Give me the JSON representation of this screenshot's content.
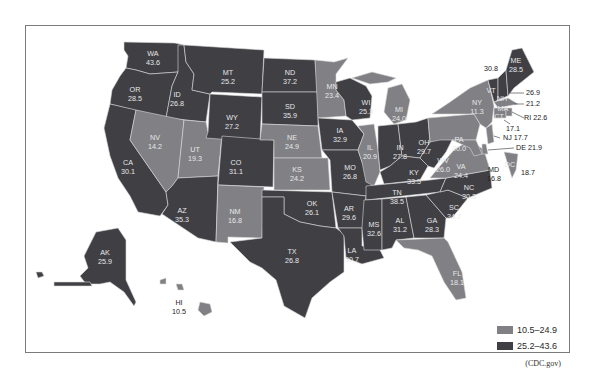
{
  "legend": {
    "items": [
      {
        "label": "10.5–24.9",
        "color": "#808085"
      },
      {
        "label": "25.2–43.6",
        "color": "#3f3f44"
      }
    ]
  },
  "source": "(CDC.gov)",
  "colors": {
    "dark": "#3f3f44",
    "light": "#808085",
    "border": "#d9d9d9"
  },
  "states": [
    {
      "abbr": "WA",
      "value": "43.6",
      "class": "dark"
    },
    {
      "abbr": "OR",
      "value": "28.5",
      "class": "dark"
    },
    {
      "abbr": "CA",
      "value": "30.1",
      "class": "dark"
    },
    {
      "abbr": "ID",
      "value": "26.8",
      "class": "dark"
    },
    {
      "abbr": "NV",
      "value": "14.2",
      "class": "light"
    },
    {
      "abbr": "UT",
      "value": "19.3",
      "class": "light"
    },
    {
      "abbr": "AZ",
      "value": "35.3",
      "class": "dark"
    },
    {
      "abbr": "MT",
      "value": "25.2",
      "class": "dark"
    },
    {
      "abbr": "WY",
      "value": "27.2",
      "class": "dark"
    },
    {
      "abbr": "CO",
      "value": "31.1",
      "class": "dark"
    },
    {
      "abbr": "NM",
      "value": "16.8",
      "class": "light"
    },
    {
      "abbr": "ND",
      "value": "37.2",
      "class": "dark"
    },
    {
      "abbr": "SD",
      "value": "35.9",
      "class": "dark"
    },
    {
      "abbr": "NE",
      "value": "24.9",
      "class": "light"
    },
    {
      "abbr": "KS",
      "value": "24.2",
      "class": "light"
    },
    {
      "abbr": "OK",
      "value": "26.1",
      "class": "dark"
    },
    {
      "abbr": "TX",
      "value": "26.8",
      "class": "dark"
    },
    {
      "abbr": "MN",
      "value": "23.4",
      "class": "light"
    },
    {
      "abbr": "IA",
      "value": "32.9",
      "class": "dark"
    },
    {
      "abbr": "MO",
      "value": "26.8",
      "class": "dark"
    },
    {
      "abbr": "AR",
      "value": "29.6",
      "class": "dark"
    },
    {
      "abbr": "LA",
      "value": "30.7",
      "class": "dark"
    },
    {
      "abbr": "WI",
      "value": "25.3",
      "class": "dark"
    },
    {
      "abbr": "IL",
      "value": "20.9",
      "class": "light"
    },
    {
      "abbr": "MI",
      "value": "24.0",
      "class": "light"
    },
    {
      "abbr": "IN",
      "value": "27.8",
      "class": "dark"
    },
    {
      "abbr": "OH",
      "value": "29.7",
      "class": "dark"
    },
    {
      "abbr": "KY",
      "value": "33.5",
      "class": "dark"
    },
    {
      "abbr": "TN",
      "value": "38.5",
      "class": "dark"
    },
    {
      "abbr": "MS",
      "value": "32.6",
      "class": "dark"
    },
    {
      "abbr": "AL",
      "value": "31.2",
      "class": "dark"
    },
    {
      "abbr": "GA",
      "value": "28.3",
      "class": "dark"
    },
    {
      "abbr": "FL",
      "value": "18.1",
      "class": "light"
    },
    {
      "abbr": "SC",
      "value": "34.7",
      "class": "dark"
    },
    {
      "abbr": "NC",
      "value": "30.3",
      "class": "dark"
    },
    {
      "abbr": "VA",
      "value": "24.4",
      "class": "light"
    },
    {
      "abbr": "WV",
      "value": "26.0",
      "class": "dark"
    },
    {
      "abbr": "PA",
      "value": "20.0",
      "class": "light"
    },
    {
      "abbr": "NY",
      "value": "11.3",
      "class": "light"
    },
    {
      "abbr": "VT",
      "value": "30.8",
      "class": "dark"
    },
    {
      "abbr": "NH",
      "value": "26.9",
      "class": "dark"
    },
    {
      "abbr": "ME",
      "value": "28.5",
      "class": "dark"
    },
    {
      "abbr": "MA",
      "value": "21.2",
      "class": "light"
    },
    {
      "abbr": "RI",
      "value": "22.6",
      "class": "light"
    },
    {
      "abbr": "CT",
      "value": "17.1",
      "class": "light"
    },
    {
      "abbr": "NJ",
      "value": "17.7",
      "class": "light"
    },
    {
      "abbr": "DE",
      "value": "21.9",
      "class": "light"
    },
    {
      "abbr": "MD",
      "value": "16.8",
      "class": "light"
    },
    {
      "abbr": "DC",
      "value": "18.7",
      "class": "light"
    },
    {
      "abbr": "AK",
      "value": "25.9",
      "class": "dark"
    },
    {
      "abbr": "HI",
      "value": "10.5",
      "class": "light"
    }
  ],
  "labels": {
    "WA": "WA",
    "OR": "OR",
    "CA": "CA",
    "ID": "ID",
    "NV": "NV",
    "UT": "UT",
    "AZ": "AZ",
    "MT": "MT",
    "WY": "WY",
    "CO": "CO",
    "NM": "NM",
    "ND": "ND",
    "SD": "SD",
    "NE": "NE",
    "KS": "KS",
    "OK": "OK",
    "TX": "TX",
    "MN": "MN",
    "IA": "IA",
    "MO": "MO",
    "AR": "AR",
    "LA": "LA",
    "WI": "WI",
    "IL": "IL",
    "MI": "MI",
    "IN": "IN",
    "OH": "OH",
    "KY": "KY",
    "TN": "TN",
    "MS": "MS",
    "AL": "AL",
    "GA": "GA",
    "FL": "FL",
    "SC": "SC",
    "NC": "NC",
    "VA": "VA",
    "WV": "WV",
    "PA": "PA",
    "NY": "NY",
    "VT": "VT",
    "NH": "NH",
    "ME": "ME",
    "MA": "MA",
    "CT": "CT",
    "MD": "MD",
    "DC": "DC",
    "AK": "AK",
    "HI": "HI"
  },
  "values": {
    "WA": "43.6",
    "OR": "28.5",
    "CA": "30.1",
    "ID": "26.8",
    "NV": "14.2",
    "UT": "19.3",
    "AZ": "35.3",
    "MT": "25.2",
    "WY": "27.2",
    "CO": "31.1",
    "NM": "16.8",
    "ND": "37.2",
    "SD": "35.9",
    "NE": "24.9",
    "KS": "24.2",
    "OK": "26.1",
    "TX": "26.8",
    "MN": "23.4",
    "IA": "32.9",
    "MO": "26.8",
    "AR": "29.6",
    "LA": "30.7",
    "WI": "25.3",
    "IL": "20.9",
    "MI": "24.0",
    "IN": "27.8",
    "OH": "29.7",
    "KY": "33.5",
    "TN": "38.5",
    "MS": "32.6",
    "AL": "31.2",
    "GA": "28.3",
    "FL": "18.1",
    "SC": "34.7",
    "NC": "30.3",
    "VA": "24.4",
    "WV": "26.0",
    "PA": "20.0",
    "NY": "11.3",
    "ME": "28.5",
    "MD": "16.8",
    "AK": "25.9",
    "HI": "10.5"
  },
  "callouts": {
    "VT": "30.8",
    "NH": "26.9",
    "MA": "21.2",
    "RI": "RI 22.6",
    "CT": "17.1",
    "NJ": "NJ 17.7",
    "DE": "DE 21.9",
    "DC": "18.7"
  }
}
